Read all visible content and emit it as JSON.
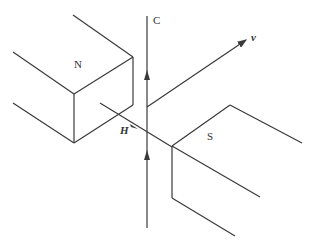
{
  "diagram": {
    "labels": {
      "north_pole": "N",
      "south_pole": "S",
      "conductor": "C",
      "velocity": "v",
      "field": "H"
    },
    "colors": {
      "line": "#3a3a3a",
      "background": "#ffffff"
    }
  }
}
